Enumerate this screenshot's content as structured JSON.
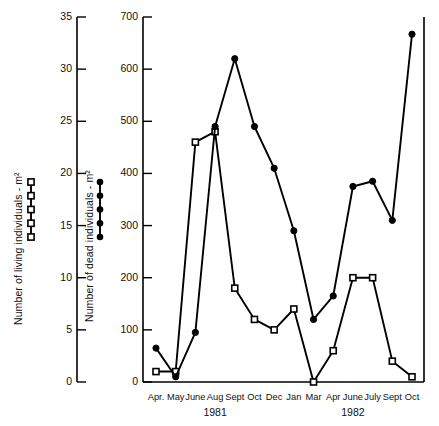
{
  "chart_data": {
    "type": "line",
    "title": "",
    "xlabel": "",
    "categories": [
      "Apr.",
      "May",
      "June",
      "Aug",
      "Sept",
      "Oct",
      "Dec",
      "Jan",
      "Mar",
      "Apr",
      "June",
      "July",
      "Sept",
      "Oct"
    ],
    "year_groups": [
      {
        "label": "1981",
        "from_index": 0,
        "to_index": 6
      },
      {
        "label": "1982",
        "from_index": 7,
        "to_index": 13
      }
    ],
    "axes": [
      {
        "id": "living",
        "label": "Number of living individuals - m²",
        "position": "left-outer",
        "ylim": [
          0,
          35
        ],
        "ticks": [
          0,
          5,
          10,
          15,
          20,
          25,
          30,
          35
        ],
        "ticklabels": [
          "0",
          "5",
          "10",
          "15",
          "20",
          "25",
          "30",
          "35"
        ]
      },
      {
        "id": "dead",
        "label": "Number of dead individuals - m²",
        "position": "left-inner",
        "ylim": [
          0,
          700
        ],
        "ticks": [
          0,
          100,
          200,
          300,
          400,
          500,
          600,
          700
        ],
        "ticklabels": [
          "0",
          "100",
          "200",
          "300",
          "400",
          "500",
          "600",
          "700"
        ]
      }
    ],
    "grid": false,
    "legend_position": "none",
    "series": [
      {
        "name": "Number of living individuals - m²",
        "axis": "living",
        "marker": "open-square",
        "color": "#000000",
        "values": [
          1,
          1,
          23,
          24,
          9,
          6,
          5,
          7,
          0,
          3,
          10,
          10,
          2,
          0.5
        ]
      },
      {
        "name": "Number of dead individuals - m²",
        "axis": "dead",
        "marker": "filled-circle",
        "color": "#000000",
        "values": [
          65,
          10,
          95,
          490,
          620,
          490,
          410,
          290,
          120,
          165,
          375,
          385,
          310,
          667
        ]
      }
    ],
    "key_markers": {
      "living_sample_count": 5,
      "dead_sample_count": 5,
      "living_marker": "open-square",
      "dead_marker": "filled-circle"
    }
  }
}
